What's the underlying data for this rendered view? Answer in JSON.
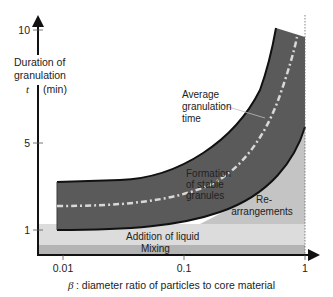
{
  "diagram": {
    "y_axis": {
      "title_line1": "Duration of",
      "title_line2": "granulation",
      "symbol": "t",
      "unit": "(min)",
      "ticks": [
        {
          "label": "10",
          "value": 10
        },
        {
          "label": "5",
          "value": 5
        },
        {
          "label": "1",
          "value": 1
        }
      ]
    },
    "x_axis": {
      "symbol": "β",
      "title": ": diameter ratio of particles to core material",
      "ticks": [
        {
          "label": "0.01",
          "value": 0.01
        },
        {
          "label": "0.1",
          "value": 0.1
        },
        {
          "label": "1",
          "value": 1
        }
      ]
    },
    "regions": {
      "average_line_1": "Average",
      "average_line_2": "granulation",
      "average_line_3": "time",
      "formation_1": "Formation",
      "formation_2": "of stable",
      "formation_3": "granules",
      "rearr_1": "Re-",
      "rearr_2": "arrangements",
      "addition": "Addition of liquid",
      "mixing": "Mixing"
    },
    "colors": {
      "band": "#5a5a5a",
      "band_edge": "#111111",
      "average_line": "#d8d8d8",
      "rearrangements": "#c4c4c4",
      "addition": "#dcdcdc",
      "mixing": "#b4b4b4",
      "axis": "#111111"
    }
  }
}
